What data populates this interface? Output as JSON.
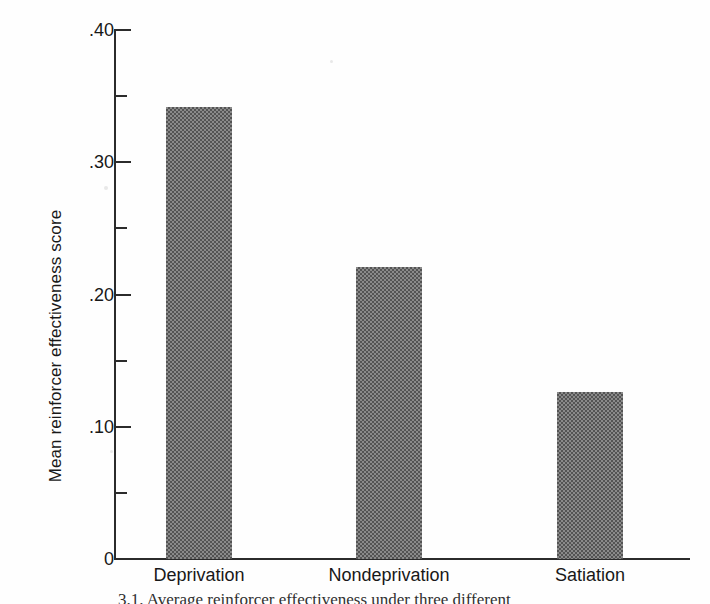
{
  "figure": {
    "caption": "3.1.  Average reinforcer effectiveness under three different"
  },
  "chart_data": {
    "type": "bar",
    "title": "",
    "xlabel": "",
    "ylabel": "Mean reinforcer effectiveness score",
    "categories": [
      "Deprivation",
      "Nondeprivation",
      "Satiation"
    ],
    "values": [
      0.342,
      0.221,
      0.126
    ],
    "ylim": [
      0,
      0.4
    ],
    "ytick_values": [
      0,
      0.05,
      0.1,
      0.15,
      0.2,
      0.25,
      0.3,
      0.35,
      0.4
    ],
    "ytick_labels": [
      "0",
      "",
      ".10",
      "",
      ".20",
      "",
      ".30",
      "",
      ".40"
    ],
    "ytick_major": [
      0,
      0.1,
      0.2,
      0.3,
      0.4
    ],
    "ytick_minor": [
      0.05,
      0.15,
      0.25,
      0.35
    ],
    "grid": false,
    "legend": false,
    "bar_color": "#8a8a8a",
    "axis_color": "#2b2b2b",
    "background": "#ffffff"
  }
}
